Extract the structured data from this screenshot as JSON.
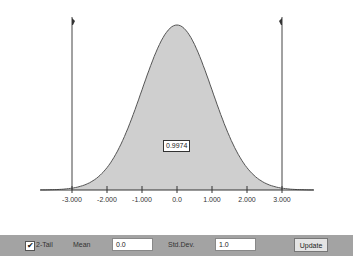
{
  "chart_data": {
    "type": "area",
    "title": "",
    "xlabel": "",
    "ylabel": "",
    "distribution": "normal",
    "mean": 0.0,
    "std_dev": 1.0,
    "shaded_range": [
      -3.0,
      3.0
    ],
    "shaded_area": 0.9974,
    "x_ticks": [
      "-3.000",
      "-2.000",
      "-1.000",
      "0.0",
      "1.000",
      "2.000",
      "3.000"
    ],
    "xlim": [
      -4.0,
      4.0
    ]
  },
  "plot": {
    "area_label": "0.9974",
    "ticks": [
      "-3.000",
      "-2.000",
      "-1.000",
      "0.0",
      "1.000",
      "2.000",
      "3.000"
    ],
    "fill_color": "#cfcfcf"
  },
  "toolbar": {
    "two_tail_label": "2-Tail",
    "two_tail_checked": true,
    "mean_label": "Mean",
    "mean_value": "0.0",
    "std_label": "Std.Dev.",
    "std_value": "1.0",
    "update_label": "Update",
    "check_glyph": "✔"
  }
}
